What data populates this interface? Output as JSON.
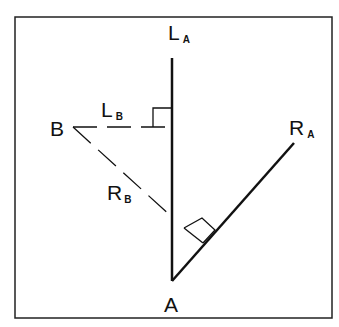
{
  "diagram": {
    "frame": {
      "x": 15,
      "y": 17,
      "width": 317,
      "height": 301,
      "stroke": "#222222"
    },
    "points": {
      "A": {
        "label": "A",
        "x": 172,
        "y": 281
      },
      "B": {
        "label": "B",
        "x": 73,
        "y": 127
      }
    },
    "labels": {
      "LA": {
        "main": "L",
        "sub": "A"
      },
      "LB": {
        "main": "L",
        "sub": "B"
      },
      "RA": {
        "main": "R",
        "sub": "A"
      },
      "RB": {
        "main": "R",
        "sub": "B"
      },
      "A": "A",
      "B": "B"
    },
    "lines": [
      {
        "name": "L_A",
        "style": "solid",
        "from": [
          172,
          58
        ],
        "to": [
          172,
          281
        ]
      },
      {
        "name": "R_A",
        "style": "solid",
        "from": [
          172,
          281
        ],
        "to": [
          294,
          143
        ]
      },
      {
        "name": "L_B",
        "style": "dashed",
        "from": [
          73,
          127
        ],
        "to": [
          172,
          127
        ]
      },
      {
        "name": "R_B",
        "style": "dashed",
        "from": [
          73,
          127
        ],
        "to": [
          172,
          217
        ]
      }
    ],
    "right_angles": [
      {
        "at": "L_B foot on L_A",
        "size": 19
      },
      {
        "at": "R_A perpendicular foot",
        "size": 18
      }
    ],
    "colors": {
      "ink": "#111111",
      "background": "#ffffff"
    }
  }
}
